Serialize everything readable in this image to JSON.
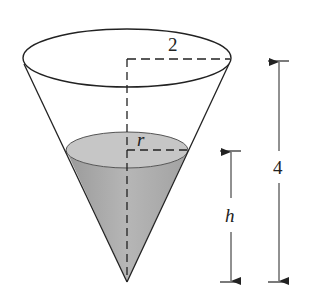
{
  "figure": {
    "labels": {
      "top_radius": "2",
      "water_radius": "r",
      "water_height": "h",
      "total_height": "4"
    },
    "colors": {
      "outline": "#222222",
      "water_fill": "#b3b3b3",
      "water_surface": "#c4c4c4",
      "background": "#ffffff"
    }
  }
}
